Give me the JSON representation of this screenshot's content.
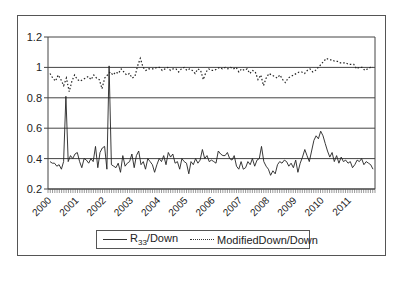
{
  "chart_data": {
    "type": "line",
    "title": "",
    "xlabel": "",
    "ylabel": "",
    "ylim": [
      0.2,
      1.2
    ],
    "yticks": [
      "0.2",
      "0.4",
      "0.6",
      "0.8",
      "1",
      "1.2"
    ],
    "x_tick_labels": [
      "2000",
      "2001",
      "2002",
      "2003",
      "2004",
      "2005",
      "2006",
      "2007",
      "2008",
      "2009",
      "2010",
      "2011"
    ],
    "grid": "horizontal",
    "legend_position": "bottom",
    "series": [
      {
        "name": "R33/Down",
        "style": "solid",
        "values": [
          0.38,
          0.37,
          0.37,
          0.35,
          0.36,
          0.33,
          0.38,
          0.81,
          0.38,
          0.42,
          0.4,
          0.43,
          0.44,
          0.38,
          0.34,
          0.4,
          0.39,
          0.37,
          0.4,
          0.38,
          0.48,
          0.34,
          0.44,
          0.47,
          0.48,
          0.33,
          1.01,
          0.36,
          0.35,
          0.34,
          0.37,
          0.31,
          0.42,
          0.35,
          0.37,
          0.38,
          0.43,
          0.34,
          0.42,
          0.45,
          0.36,
          0.38,
          0.33,
          0.4,
          0.38,
          0.36,
          0.31,
          0.36,
          0.4,
          0.38,
          0.42,
          0.36,
          0.44,
          0.41,
          0.43,
          0.37,
          0.38,
          0.33,
          0.4,
          0.38,
          0.37,
          0.3,
          0.38,
          0.36,
          0.4,
          0.37,
          0.39,
          0.46,
          0.4,
          0.42,
          0.38,
          0.39,
          0.38,
          0.37,
          0.45,
          0.43,
          0.42,
          0.42,
          0.44,
          0.4,
          0.39,
          0.42,
          0.35,
          0.33,
          0.38,
          0.33,
          0.34,
          0.38,
          0.36,
          0.4,
          0.35,
          0.39,
          0.4,
          0.48,
          0.38,
          0.35,
          0.33,
          0.29,
          0.32,
          0.3,
          0.36,
          0.38,
          0.37,
          0.39,
          0.38,
          0.35,
          0.37,
          0.34,
          0.39,
          0.31,
          0.37,
          0.41,
          0.46,
          0.42,
          0.38,
          0.45,
          0.52,
          0.55,
          0.53,
          0.58,
          0.55,
          0.5,
          0.45,
          0.41,
          0.44,
          0.38,
          0.42,
          0.37,
          0.41,
          0.38,
          0.39,
          0.37,
          0.38,
          0.34,
          0.36,
          0.39,
          0.38,
          0.4,
          0.36,
          0.38,
          0.37,
          0.36,
          0.33
        ]
      },
      {
        "name": "ModifiedDown/Down",
        "style": "dotted",
        "values": [
          0.96,
          0.93,
          0.91,
          0.95,
          0.92,
          0.88,
          0.93,
          0.84,
          0.91,
          0.95,
          0.92,
          0.91,
          0.92,
          0.93,
          0.94,
          0.92,
          0.95,
          0.93,
          0.92,
          0.86,
          0.93,
          0.95,
          0.97,
          0.95,
          0.97,
          0.96,
          0.99,
          0.97,
          0.95,
          0.96,
          0.93,
          0.94,
          1.01,
          1.06,
          1.0,
          0.98,
          0.99,
          0.99,
          0.99,
          1.0,
          1.0,
          0.98,
          0.99,
          1.0,
          0.98,
          0.99,
          0.99,
          0.97,
          0.99,
          1.0,
          0.98,
          0.99,
          0.98,
          0.96,
          0.99,
          0.98,
          0.92,
          0.97,
          0.99,
          0.98,
          0.98,
          0.99,
          1.0,
          0.99,
          1.0,
          0.99,
          1.0,
          0.99,
          1.0,
          0.97,
          0.99,
          0.98,
          0.99,
          0.96,
          0.98,
          0.97,
          0.92,
          0.95,
          0.88,
          0.93,
          0.96,
          0.95,
          0.94,
          0.93,
          0.95,
          0.92,
          0.9,
          0.93,
          0.94,
          0.95,
          0.96,
          0.97,
          0.97,
          0.96,
          0.98,
          0.99,
          0.97,
          0.98,
          1.0,
          1.02,
          1.04,
          1.06,
          1.05,
          1.05,
          1.04,
          1.04,
          1.03,
          1.03,
          1.03,
          1.02,
          1.02,
          1.02,
          0.99,
          1.0,
          1.0,
          0.98,
          0.99,
          1.0,
          1.0
        ]
      }
    ]
  },
  "legend": {
    "items": [
      {
        "label_main": "R",
        "label_sub": "33",
        "label_rest": "/Down"
      },
      {
        "label_main": "ModifiedDown/Down"
      }
    ]
  }
}
